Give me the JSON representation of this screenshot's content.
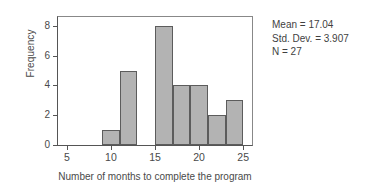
{
  "chart_data": {
    "type": "bar",
    "title": "",
    "subtitle": "",
    "xlabel": "Number of months to complete the program",
    "ylabel": "Frequency",
    "xlim": [
      4,
      26
    ],
    "ylim": [
      0,
      8.6
    ],
    "grid": false,
    "legend": null,
    "bin_width": 2,
    "categories": [
      "9-11",
      "11-13",
      "13-15",
      "15-17",
      "17-19",
      "19-21",
      "21-23",
      "23-25"
    ],
    "bin_edges": [
      9,
      11,
      13,
      15,
      17,
      19,
      21,
      23,
      25
    ],
    "values": [
      1,
      5,
      0,
      8,
      4,
      4,
      2,
      3
    ],
    "bars": [
      {
        "start": 9,
        "end": 11,
        "value": 1
      },
      {
        "start": 11,
        "end": 13,
        "value": 5
      },
      {
        "start": 15,
        "end": 17,
        "value": 8
      },
      {
        "start": 17,
        "end": 19,
        "value": 4
      },
      {
        "start": 19,
        "end": 21,
        "value": 4
      },
      {
        "start": 21,
        "end": 23,
        "value": 2
      },
      {
        "start": 23,
        "end": 25,
        "value": 3
      }
    ],
    "xticks": [
      5,
      10,
      15,
      20,
      25
    ],
    "xtick_labels": [
      "5",
      "10",
      "15",
      "20",
      "25"
    ],
    "yticks": [
      0,
      2,
      4,
      6,
      8
    ],
    "ytick_labels": [
      "0",
      "2",
      "4",
      "6",
      "8"
    ],
    "annotations": [
      "Mean = 17.04",
      "Std. Dev. = 3.907",
      "N = 27"
    ],
    "colors": {
      "bar_fill": "#b3b3b3",
      "bar_edge": "#5c5c5c",
      "axis": "#555555",
      "text": "#3f3f3f",
      "background": "#ffffff"
    }
  },
  "stats": {
    "mean_label": "Mean = 17.04",
    "std_dev_label": "Std. Dev. = 3.907",
    "n_label": "N = 27"
  }
}
